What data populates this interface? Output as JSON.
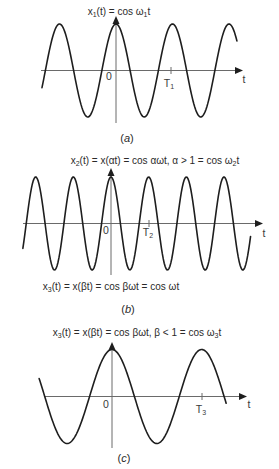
{
  "figure": {
    "panels": [
      {
        "id": "a",
        "title": [
          "x",
          "1",
          "(t) = cos ω",
          "1",
          "t"
        ],
        "origin_label": "0",
        "period_label": [
          "T",
          "1"
        ],
        "axis_label": "t",
        "caption": [
          "(",
          "a",
          ")"
        ]
      },
      {
        "id": "b",
        "title": [
          "x",
          "2",
          "(t) = x(αt) = cos αωt, α > 1 = cos ω",
          "2",
          "t"
        ],
        "origin_label": "0",
        "period_label": [
          "T",
          "2"
        ],
        "axis_label": "t",
        "note": [
          "x",
          "3",
          "(t) = x(βt) = cos βωt = cos ωt"
        ],
        "caption": [
          "(",
          "b",
          ")"
        ]
      },
      {
        "id": "c",
        "title": [
          "x",
          "3",
          "(t) = x(βt) = cos βωt, β < 1 = cos ω",
          "3",
          "t"
        ],
        "origin_label": "0",
        "period_label": [
          "T",
          "3"
        ],
        "axis_label": "t",
        "caption": [
          "(",
          "c",
          ")"
        ]
      }
    ]
  },
  "chart_data": [
    {
      "type": "line",
      "title": "x1(t) = cos ω1t",
      "function": "cos",
      "amplitude": 1,
      "relative_frequency": 1.0,
      "period_marker": "T1",
      "period_marker_t": 1.0,
      "t_units": "T1",
      "curve_t_range": [
        -1.31,
        2.14
      ],
      "axis_t_range": [
        -1.33,
        2.23
      ],
      "xlabel": "t",
      "origin_label": "0",
      "caption": "(a)"
    },
    {
      "type": "line",
      "title": "x2(t) = x(αt) = cos αωt, α > 1 = cos ω2t",
      "function": "cos",
      "amplitude": 1,
      "relative_frequency": 1.5,
      "period_marker": "T2",
      "period_marker_t": 0.667,
      "t_units": "T1",
      "curve_t_range": [
        -1.56,
        2.47
      ],
      "axis_t_range": [
        -1.56,
        2.69
      ],
      "xlabel": "t",
      "origin_label": "0",
      "annotation": "x3(t) = x(βt) = cos βωt = cos ωt",
      "caption": "(b)"
    },
    {
      "type": "line",
      "title": "x3(t) = x(βt) = cos βωt, β < 1 = cos ω3t",
      "function": "cos",
      "amplitude": 1,
      "relative_frequency": 0.63,
      "period_marker": "T3",
      "period_marker_t": 1.59,
      "t_units": "T1",
      "curve_t_range": [
        -1.29,
        2.02
      ],
      "axis_t_range": [
        -1.19,
        2.39
      ],
      "xlabel": "t",
      "origin_label": "0",
      "caption": "(c)"
    }
  ]
}
